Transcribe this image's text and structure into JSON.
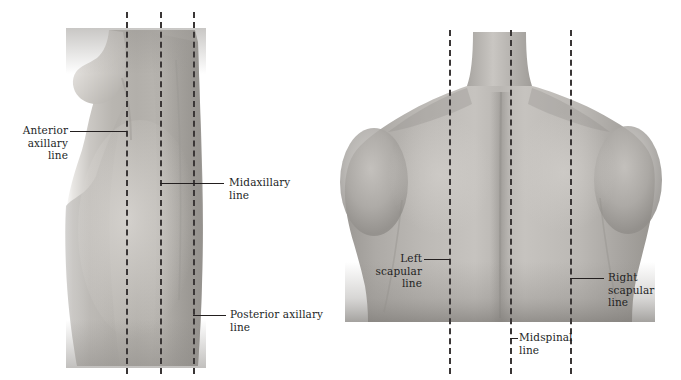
{
  "figure": {
    "background": "#ffffff",
    "ink_color": "#231f1f",
    "dash_color": "#3a3636",
    "width": 681,
    "height": 380
  },
  "panels": [
    {
      "name": "lateral-view",
      "view_label": "Lateral chest wall",
      "reference_lines": [
        {
          "name": "anterior-axillary",
          "label": "Anterior\naxillary line",
          "x": 126
        },
        {
          "name": "midaxillary",
          "label": "Midaxillary\nline",
          "x": 160
        },
        {
          "name": "posterior-axillary",
          "label": "Posterior axillary\nline",
          "x": 193
        }
      ]
    },
    {
      "name": "posterior-view",
      "view_label": "Posterior chest wall",
      "reference_lines": [
        {
          "name": "left-scapular",
          "label": "Left scapular\nline",
          "x": 449
        },
        {
          "name": "midspinal",
          "label": "Midspinal\nline",
          "x": 510
        },
        {
          "name": "right-scapular",
          "label": "Right scapular\nline",
          "x": 570
        }
      ]
    }
  ],
  "labels": {
    "anterior_axillary": "Anterior\naxillary line",
    "midaxillary": "Midaxillary\nline",
    "posterior_axillary": "Posterior axillary\nline",
    "left_scapular": "Left scapular\nline",
    "midspinal": "Midspinal\nline",
    "right_scapular": "Right scapular\nline"
  }
}
